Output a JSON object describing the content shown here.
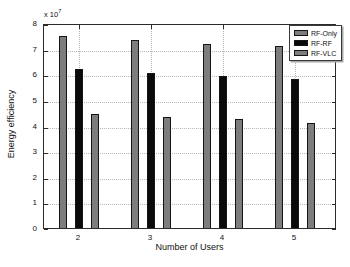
{
  "chart_data": {
    "type": "bar",
    "title": "",
    "xlabel": "Number of Users",
    "ylabel": "Energy efficiency",
    "y_multiplier_label": "x 10",
    "y_multiplier_exponent": "7",
    "values_unit": "x10^7",
    "categories": [
      "2",
      "3",
      "4",
      "5"
    ],
    "series": [
      {
        "name": "RF-Only",
        "color": "#7d7d7d",
        "values": [
          7.5,
          7.35,
          7.2,
          7.1
        ]
      },
      {
        "name": "RF-RF",
        "color": "#0a0a0a",
        "values": [
          6.2,
          6.05,
          5.95,
          5.8
        ]
      },
      {
        "name": "RF-VLC",
        "color": "#7d7d7d",
        "values": [
          4.45,
          4.35,
          4.25,
          4.1
        ]
      }
    ],
    "ylim": [
      0,
      8
    ],
    "yticks": [
      "0",
      "1",
      "2",
      "3",
      "4",
      "5",
      "6",
      "7",
      "8"
    ],
    "grid": true,
    "legend_position": "top-right",
    "colors": {
      "axis": "#2b2b2b",
      "grid": "#b8b8b8",
      "background": "#ffffff"
    }
  }
}
